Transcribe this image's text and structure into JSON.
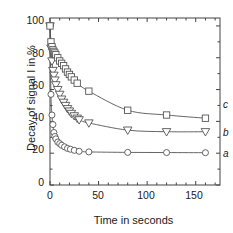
{
  "chart_data": {
    "type": "scatter",
    "title": "",
    "xlabel": "Time in seconds",
    "ylabel": "Decay of signal I in %",
    "xlim": [
      0,
      175
    ],
    "ylim": [
      0,
      105
    ],
    "xticks": [
      0,
      50,
      100,
      150
    ],
    "yticks": [
      0,
      20,
      40,
      60,
      80,
      100
    ],
    "grid": false,
    "legend_position": "right-inline",
    "series": [
      {
        "name": "a",
        "label": "a",
        "marker": "circle",
        "color": "#555555",
        "plateau": 20,
        "x": [
          0,
          1,
          2,
          3,
          4,
          5,
          6,
          8,
          10,
          12,
          15,
          18,
          21,
          25,
          30,
          40,
          80,
          120,
          160
        ],
        "y": [
          100,
          57,
          44,
          38,
          33,
          30.5,
          29,
          27,
          26,
          25,
          24,
          23,
          22.5,
          21.8,
          21.2,
          20.8,
          20.5,
          20.4,
          20.3
        ]
      },
      {
        "name": "b",
        "label": "b",
        "marker": "triangle-down",
        "color": "#555555",
        "plateau": 33,
        "x": [
          0,
          1,
          2,
          3,
          4,
          5,
          6,
          8,
          10,
          12,
          14,
          16,
          18,
          20,
          22,
          25,
          28,
          30,
          40,
          80,
          120,
          160
        ],
        "y": [
          100,
          86,
          78,
          72,
          69,
          66,
          63,
          60,
          57,
          54,
          52,
          50,
          48,
          46.5,
          45,
          43.5,
          42,
          41,
          39,
          34.5,
          33.5,
          33.5
        ]
      },
      {
        "name": "c",
        "label": "c",
        "marker": "square",
        "color": "#555555",
        "plateau": 42,
        "x": [
          0,
          1,
          2,
          3,
          4,
          5,
          6,
          8,
          10,
          12,
          14,
          16,
          18,
          20,
          22,
          25,
          28,
          40,
          80,
          120,
          160
        ],
        "y": [
          100,
          90,
          87,
          85,
          84,
          83,
          82,
          80,
          78,
          76.5,
          75,
          73,
          71,
          69.5,
          68,
          66,
          64,
          59,
          47,
          44,
          42
        ]
      }
    ],
    "curve_labels": [
      {
        "label": "c",
        "y_value": 42
      },
      {
        "label": "b",
        "y_value": 33.5
      },
      {
        "label": "a",
        "y_value": 20.3
      }
    ]
  }
}
